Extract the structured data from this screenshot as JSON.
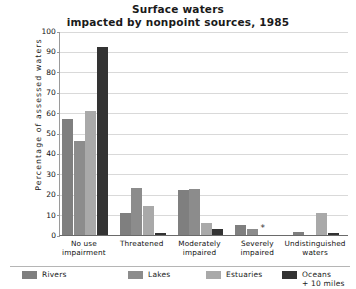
{
  "chart_data": {
    "type": "bar",
    "title": "Surface waters impacted by nonpoint sources, 1985",
    "title_line1": "Surface waters",
    "title_line2": "impacted by nonpoint sources, 1985",
    "xlabel": "",
    "ylabel": "Percentage of assessed waters",
    "ylim": [
      0,
      100
    ],
    "ytick_labels": [
      "0",
      "10",
      "20",
      "30",
      "40",
      "50",
      "60",
      "70",
      "80",
      "90",
      "100"
    ],
    "ytick_values": [
      0,
      10,
      20,
      30,
      40,
      50,
      60,
      70,
      80,
      90,
      100
    ],
    "grid": true,
    "legend_position": "bottom",
    "categories": [
      "No use impairment",
      "Threatened",
      "Moderately impaired",
      "Severely impaired",
      "Undistinguished waters"
    ],
    "category_lines": [
      [
        "No use",
        "impairment"
      ],
      [
        "Threatened",
        ""
      ],
      [
        "Moderately",
        "impaired"
      ],
      [
        "Severely",
        "impaired"
      ],
      [
        "Undistinguished",
        "waters"
      ]
    ],
    "series": [
      {
        "name": "Rivers",
        "color": "#7f7f7f",
        "values": [
          57,
          11,
          22,
          5,
          1.5
        ]
      },
      {
        "name": "Lakes",
        "color": "#8c8c8c",
        "values": [
          46,
          23,
          22.5,
          3,
          0
        ]
      },
      {
        "name": "Estuaries",
        "color": "#a9a9a9",
        "values": [
          61,
          14,
          6,
          0,
          11
        ]
      },
      {
        "name": "Oceans + 10 miles",
        "color": "#333333",
        "values": [
          92,
          1,
          3,
          0,
          1
        ]
      }
    ],
    "annotations": [
      {
        "text": "*",
        "category": "Severely impaired",
        "series": "Estuaries"
      }
    ]
  },
  "legend": {
    "items": [
      {
        "label": "Rivers",
        "sub": "",
        "color": "#7f7f7f"
      },
      {
        "label": "Lakes",
        "sub": "",
        "color": "#8c8c8c"
      },
      {
        "label": "Estuaries",
        "sub": "",
        "color": "#a9a9a9"
      },
      {
        "label": "Oceans",
        "sub": "+ 10 miles",
        "color": "#333333"
      }
    ]
  }
}
